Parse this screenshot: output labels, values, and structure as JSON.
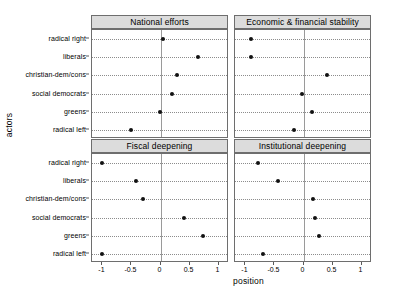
{
  "chart_data": {
    "type": "scatter",
    "title": "",
    "xlabel": "position",
    "ylabel": "actors",
    "xlim": [
      -1.18,
      1.18
    ],
    "xticks": [
      -1,
      -0.5,
      0,
      0.5,
      1
    ],
    "xticklabels": [
      "-1",
      "-0.5",
      "0",
      "0.5",
      "1"
    ],
    "categories": [
      "radical right",
      "liberals",
      "christian-dem/cons",
      "social democrats",
      "greens",
      "radical left"
    ],
    "grid": "dotted-horizontal",
    "reference_line_x": 0,
    "legend": "none",
    "panels": [
      {
        "label": "National efforts",
        "row": 0,
        "col": 0,
        "values": [
          0.05,
          0.65,
          0.28,
          0.19,
          -0.01,
          -0.51
        ]
      },
      {
        "label": "Economic & financial stability",
        "row": 0,
        "col": 1,
        "values": [
          -0.91,
          -0.9,
          0.41,
          -0.03,
          0.15,
          -0.17
        ]
      },
      {
        "label": "Fiscal deepening",
        "row": 1,
        "col": 0,
        "values": [
          -1.0,
          -0.43,
          -0.31,
          0.4,
          0.73,
          -1.0
        ]
      },
      {
        "label": "Institutional deepening",
        "row": 1,
        "col": 1,
        "values": [
          -0.78,
          -0.44,
          0.16,
          0.19,
          0.26,
          -0.7
        ]
      }
    ]
  },
  "axis": {
    "xlabel": "position",
    "ylabel": "actors"
  }
}
